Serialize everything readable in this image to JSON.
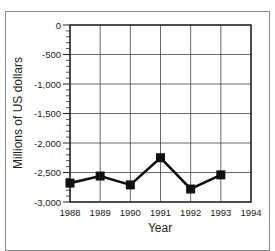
{
  "chart_data": {
    "type": "line",
    "title": "",
    "xlabel": "Year",
    "ylabel": "Millions of US dollars",
    "categories": [
      "1988",
      "1989",
      "1990",
      "1991",
      "1992",
      "1993"
    ],
    "x_ticks": [
      "1988",
      "1989",
      "1990",
      "1991",
      "1992",
      "1993",
      "1994"
    ],
    "y_ticks": [
      "0",
      "-500",
      "-1,000",
      "-1,500",
      "-2,000",
      "-2,500",
      "-3,000"
    ],
    "ylim": [
      -3000,
      0
    ],
    "xlim": [
      1988,
      1994
    ],
    "grid": true,
    "legend": null,
    "series": [
      {
        "name": "Millions of US dollars",
        "marker": "square",
        "color": "#111111",
        "values": [
          -2680,
          -2560,
          -2710,
          -2250,
          -2780,
          -2540
        ]
      }
    ]
  }
}
